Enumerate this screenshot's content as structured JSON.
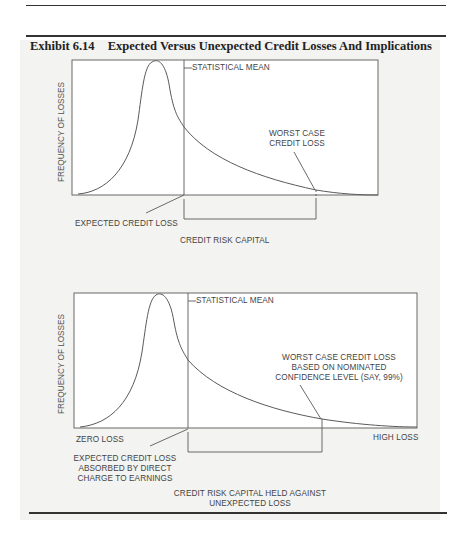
{
  "header": {
    "running_head": "…ology…",
    "exhibit_number": "Exhibit 6.14",
    "exhibit_title": "Expected Versus Unexpected Credit Losses And Implications"
  },
  "colors": {
    "page": "#ffffff",
    "figure_background": "#f3f3f1",
    "line": "#555555",
    "text": "#444444",
    "rule": "#333333"
  },
  "diagram_top": {
    "y_axis_label": "FREQUENCY OF LOSSES",
    "mean_label": "STATISTICAL MEAN",
    "worst_case_label": [
      "WORST CASE",
      "CREDIT LOSS"
    ],
    "expected_loss_label": "EXPECTED CREDIT LOSS",
    "capital_label": "CREDIT RISK CAPITAL"
  },
  "diagram_bottom": {
    "y_axis_label": "FREQUENCY OF LOSSES",
    "mean_label": "STATISTICAL MEAN",
    "worst_case_label": [
      "WORST CASE CREDIT LOSS",
      "BASED ON NOMINATED",
      "CONFIDENCE LEVEL (SAY, 99%)"
    ],
    "x_min_label": "ZERO LOSS",
    "x_max_label": "HIGH LOSS",
    "expected_loss_label": [
      "EXPECTED CREDIT LOSS",
      "ABSORBED BY DIRECT",
      "CHARGE TO EARNINGS"
    ],
    "capital_label": [
      "CREDIT RISK CAPITAL HELD AGAINST",
      "UNEXPECTED LOSS"
    ]
  }
}
